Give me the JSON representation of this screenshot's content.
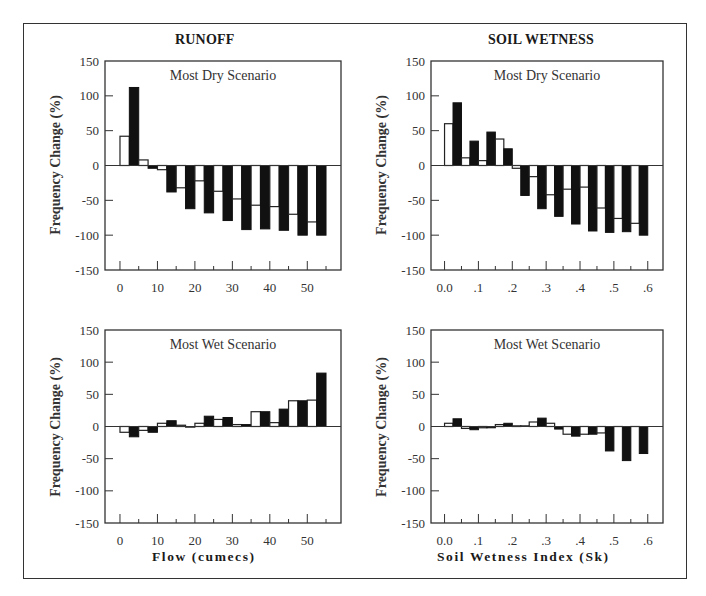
{
  "figure": {
    "column_titles": [
      "RUNOFF",
      "SOIL WETNESS"
    ],
    "xlabels": [
      "Flow   (cumecs)",
      "Soil  Wetness  Index  (Sk)"
    ],
    "ylabel": "Frequency Change (%)",
    "colors": {
      "frame": "#333333",
      "filled_bar": "#111111",
      "hollow_bar": "#ffffff",
      "axis": "#333333"
    }
  },
  "chart_data": [
    {
      "type": "bar",
      "panel": "runoff-dry",
      "title": "Most Dry Scenario",
      "column_title": "RUNOFF",
      "xlabel": "Flow (cumecs)",
      "ylabel": "Frequency Change (%)",
      "ylim": [
        -150,
        150
      ],
      "yticks": [
        150,
        100,
        50,
        0,
        -50,
        -100,
        -150
      ],
      "xlim": [
        -4,
        59
      ],
      "xticks": [
        0,
        10,
        20,
        30,
        40,
        50
      ],
      "xtick_labels": [
        "0",
        "10",
        "20",
        "30",
        "40",
        "50"
      ],
      "bin_starts": [
        0,
        5,
        10,
        15,
        20,
        25,
        30,
        35,
        40,
        45,
        50
      ],
      "bin_width": 5,
      "series": [
        {
          "name": "hollow",
          "style": "outline",
          "values": [
            42,
            8,
            -6,
            -32,
            -22,
            -37,
            -48,
            -57,
            -59,
            -70,
            -81
          ]
        },
        {
          "name": "filled",
          "style": "solid",
          "values": [
            112,
            -4,
            -38,
            -62,
            -68,
            -79,
            -92,
            -91,
            -93,
            -100,
            -100
          ]
        }
      ]
    },
    {
      "type": "bar",
      "panel": "soil-dry",
      "title": "Most Dry Scenario",
      "column_title": "SOIL WETNESS",
      "xlabel": "Soil Wetness Index (Sk)",
      "ylabel": "Frequency Change (%)",
      "ylim": [
        -150,
        150
      ],
      "yticks": [
        150,
        100,
        50,
        0,
        -50,
        -100,
        -150
      ],
      "xlim": [
        -0.04,
        0.645
      ],
      "xticks": [
        0.0,
        0.1,
        0.2,
        0.3,
        0.4,
        0.5,
        0.6
      ],
      "xtick_labels": [
        "0.0",
        ".1",
        ".2",
        ".3",
        ".4",
        ".5",
        ".6"
      ],
      "bin_starts": [
        0.0,
        0.05,
        0.1,
        0.15,
        0.2,
        0.25,
        0.3,
        0.35,
        0.4,
        0.45,
        0.5,
        0.55
      ],
      "bin_width": 0.05,
      "series": [
        {
          "name": "hollow",
          "style": "outline",
          "values": [
            60,
            11,
            7,
            38,
            -4,
            -16,
            -42,
            -34,
            -31,
            -61,
            -76,
            -83
          ]
        },
        {
          "name": "filled",
          "style": "solid",
          "values": [
            90,
            35,
            48,
            24,
            -43,
            -62,
            -73,
            -84,
            -94,
            -96,
            -95,
            -100
          ]
        }
      ]
    },
    {
      "type": "bar",
      "panel": "runoff-wet",
      "title": "Most Wet Scenario",
      "column_title": "RUNOFF",
      "xlabel": "Flow (cumecs)",
      "ylabel": "Frequency Change (%)",
      "ylim": [
        -150,
        150
      ],
      "yticks": [
        150,
        100,
        50,
        0,
        -50,
        -100,
        -150
      ],
      "xlim": [
        -4,
        59
      ],
      "xticks": [
        0,
        10,
        20,
        30,
        40,
        50
      ],
      "xtick_labels": [
        "0",
        "10",
        "20",
        "30",
        "40",
        "50"
      ],
      "bin_starts": [
        0,
        5,
        10,
        15,
        20,
        25,
        30,
        35,
        40,
        45,
        50
      ],
      "bin_width": 5,
      "series": [
        {
          "name": "hollow",
          "style": "outline",
          "values": [
            -9,
            -6,
            5,
            2,
            5,
            11,
            3,
            23,
            6,
            40,
            41
          ]
        },
        {
          "name": "filled",
          "style": "solid",
          "values": [
            -16,
            -9,
            9,
            -1,
            16,
            14,
            3,
            23,
            27,
            40,
            83
          ]
        }
      ]
    },
    {
      "type": "bar",
      "panel": "soil-wet",
      "title": "Most Wet Scenario",
      "column_title": "SOIL WETNESS",
      "xlabel": "Soil Wetness Index (Sk)",
      "ylabel": "Frequency Change (%)",
      "ylim": [
        -150,
        150
      ],
      "yticks": [
        150,
        100,
        50,
        0,
        -50,
        -100,
        -150
      ],
      "xlim": [
        -0.04,
        0.645
      ],
      "xticks": [
        0.0,
        0.1,
        0.2,
        0.3,
        0.4,
        0.5,
        0.6
      ],
      "xtick_labels": [
        "0.0",
        ".1",
        ".2",
        ".3",
        ".4",
        ".5",
        ".6"
      ],
      "bin_starts": [
        0.0,
        0.05,
        0.1,
        0.15,
        0.2,
        0.25,
        0.3,
        0.35,
        0.4,
        0.45,
        0.5,
        0.55
      ],
      "bin_width": 0.05,
      "series": [
        {
          "name": "hollow",
          "style": "outline",
          "values": [
            5,
            -3,
            -2,
            3,
            1,
            7,
            5,
            -12,
            -12,
            -10,
            0,
            0
          ]
        },
        {
          "name": "filled",
          "style": "solid",
          "values": [
            12,
            -5,
            -2,
            5,
            1,
            13,
            -4,
            -15,
            -12,
            -38,
            -53,
            -42
          ]
        }
      ]
    }
  ]
}
